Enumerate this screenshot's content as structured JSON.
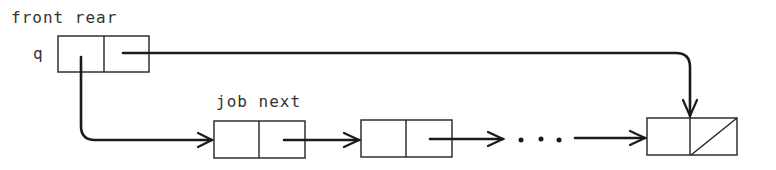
{
  "diagram": {
    "type": "linked-list queue",
    "header_label": "front rear",
    "queue_variable": "q",
    "node_label": "job next",
    "ellipsis": "· · ·",
    "queue_record": {
      "fields": [
        "front",
        "rear"
      ]
    },
    "nodes": [
      {
        "fields": [
          "job",
          "next"
        ],
        "next": "pointer"
      },
      {
        "fields": [
          "job",
          "next"
        ],
        "next": "pointer"
      },
      {
        "fields": [
          "job",
          "next"
        ],
        "next": "nil"
      }
    ],
    "pointers": [
      {
        "from": "q.front",
        "to": "first node"
      },
      {
        "from": "q.rear",
        "to": "last node"
      },
      {
        "from": "node1.next",
        "to": "node2"
      },
      {
        "from": "node2.next",
        "to": "ellipsis"
      },
      {
        "from": "ellipsis",
        "to": "last node"
      }
    ],
    "colors": {
      "stroke": "#1a1a1a",
      "text": "#333333",
      "background": "#ffffff"
    }
  }
}
